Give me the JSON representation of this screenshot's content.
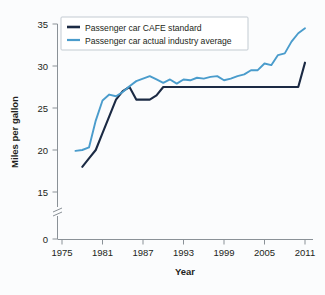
{
  "chart_data": {
    "type": "line",
    "title": "",
    "xlabel": "Year",
    "ylabel": "Miles per gallon",
    "xlim": [
      1975,
      2011
    ],
    "ylim": [
      0,
      35
    ],
    "y_axis_break": true,
    "y_break_between": [
      0,
      15
    ],
    "grid": false,
    "legend_position": "top-left-inside",
    "xticks": [
      "1975",
      "1981",
      "1987",
      "1993",
      "1999",
      "2005",
      "2011"
    ],
    "xtick_values": [
      1975,
      1981,
      1987,
      1993,
      1999,
      2005,
      2011
    ],
    "yticks": [
      "0",
      "15",
      "20",
      "25",
      "30",
      "35"
    ],
    "ytick_values": [
      0,
      15,
      20,
      25,
      30,
      35
    ],
    "series": [
      {
        "name": "Passenger car CAFE standard",
        "color": "#1b2a44",
        "x": [
          1978,
          1979,
          1980,
          1981,
          1982,
          1983,
          1984,
          1985,
          1986,
          1987,
          1988,
          1989,
          1990,
          1991,
          1992,
          1993,
          1994,
          1995,
          1996,
          1997,
          1998,
          1999,
          2000,
          2001,
          2002,
          2003,
          2004,
          2005,
          2006,
          2007,
          2008,
          2009,
          2010,
          2011
        ],
        "values": [
          18.0,
          19.0,
          20.0,
          22.0,
          24.0,
          26.0,
          27.0,
          27.5,
          26.0,
          26.0,
          26.0,
          26.5,
          27.5,
          27.5,
          27.5,
          27.5,
          27.5,
          27.5,
          27.5,
          27.5,
          27.5,
          27.5,
          27.5,
          27.5,
          27.5,
          27.5,
          27.5,
          27.5,
          27.5,
          27.5,
          27.5,
          27.5,
          27.5,
          30.4
        ]
      },
      {
        "name": "Passenger car actual industry average",
        "color": "#4a9ccc",
        "x": [
          1977,
          1978,
          1979,
          1980,
          1981,
          1982,
          1983,
          1984,
          1985,
          1986,
          1987,
          1988,
          1989,
          1990,
          1991,
          1992,
          1993,
          1994,
          1995,
          1996,
          1997,
          1998,
          1999,
          2000,
          2001,
          2002,
          2003,
          2004,
          2005,
          2006,
          2007,
          2008,
          2009,
          2010,
          2011
        ],
        "values": [
          19.9,
          20.0,
          20.3,
          23.5,
          25.9,
          26.6,
          26.4,
          26.9,
          27.6,
          28.2,
          28.5,
          28.8,
          28.4,
          28.0,
          28.4,
          27.9,
          28.4,
          28.3,
          28.6,
          28.5,
          28.7,
          28.8,
          28.3,
          28.5,
          28.8,
          29.0,
          29.5,
          29.5,
          30.3,
          30.1,
          31.3,
          31.5,
          32.9,
          33.9,
          34.5
        ]
      }
    ]
  },
  "legend": {
    "entries": [
      {
        "label": "Passenger car CAFE standard",
        "color": "#1b2a44"
      },
      {
        "label": "Passenger car actual industry average",
        "color": "#4a9ccc"
      }
    ]
  },
  "axes": {
    "x_title": "Year",
    "y_title": "Miles per gallon",
    "x_tick_labels": [
      "1975",
      "1981",
      "1987",
      "1993",
      "1999",
      "2005",
      "2011"
    ],
    "y_tick_labels": [
      "35",
      "30",
      "25",
      "20",
      "15",
      "0"
    ]
  },
  "colors": {
    "cafe_standard": "#1b2a44",
    "industry_average": "#4a9ccc",
    "axis": "#8a9197",
    "text": "#231f20",
    "background": "#fbfcfd"
  }
}
